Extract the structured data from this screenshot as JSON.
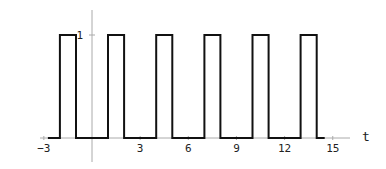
{
  "chart_data": {
    "type": "line",
    "title": "",
    "xlabel": "t",
    "ylabel": "",
    "xlim": [
      -3.0,
      16.0
    ],
    "ylim": [
      0,
      1
    ],
    "grid": false,
    "x_ticks": [
      -3,
      3,
      6,
      9,
      12,
      15
    ],
    "x_tick_labels": [
      "-3",
      "3",
      "6",
      "9",
      "12",
      "15"
    ],
    "y_ticks": [
      1
    ],
    "y_tick_labels": [
      "1"
    ],
    "series": [
      {
        "name": "square wave",
        "description": "Periodic rectangular pulse train, period 3, value 1 on [3k+1, 3k+2], 0 otherwise",
        "x": [
          -2.75,
          -2,
          -2,
          -1,
          -1,
          1,
          1,
          2,
          2,
          4,
          4,
          5,
          5,
          7,
          7,
          8,
          8,
          10,
          10,
          11,
          11,
          13,
          13,
          14,
          14,
          14.5
        ],
        "y": [
          0,
          0,
          1,
          1,
          0,
          0,
          1,
          1,
          0,
          0,
          1,
          1,
          0,
          0,
          1,
          1,
          0,
          0,
          1,
          1,
          0,
          0,
          1,
          1,
          0,
          0
        ]
      }
    ]
  },
  "axes": {
    "x_axis_label": "t",
    "y_tick_one": "1",
    "x_tick_labels": [
      "-3",
      "3",
      "6",
      "9",
      "12",
      "15"
    ]
  },
  "colors": {
    "curve": "#111111",
    "axis": "#aaaaaa",
    "text": "#222222"
  }
}
